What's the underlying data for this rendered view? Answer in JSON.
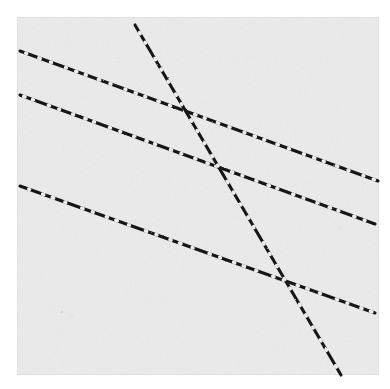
{
  "figure": {
    "canvas": {
      "width": 390,
      "height": 389
    },
    "page_background_color": "#ffffff",
    "paper": {
      "name": "scanned-paper-sheet",
      "x": 18,
      "y": 18,
      "width": 360,
      "height": 356,
      "fill_color": "#ececec",
      "edge_shadow_color": "#e0e0e0",
      "texture": "grainy-paper-speckle"
    },
    "stroke": {
      "color": "#141414",
      "width": 3.1,
      "linecap": "round",
      "dash_pattern": "broken-scanned-ink"
    }
  },
  "chart_data": {
    "type": "line",
    "subtitle": "",
    "xlabel": "",
    "ylabel": "",
    "xlim": [
      0,
      390
    ],
    "ylim": [
      389,
      0
    ],
    "grid": false,
    "legend_position": "none",
    "axes_visible": false,
    "tick_labels": {
      "x": [],
      "y": []
    },
    "coordinate_note": "Pixel coordinates, origin at top-left of the 390x389 image.",
    "series": [
      {
        "name": "line-1-upper-shallow",
        "stroke_color": "#141414",
        "slope": 0.363,
        "points": [
          {
            "x": 20,
            "y": 51
          },
          {
            "x": 378,
            "y": 181
          }
        ]
      },
      {
        "name": "line-2-middle-shallow",
        "stroke_color": "#141414",
        "slope": 0.363,
        "points": [
          {
            "x": 20,
            "y": 95
          },
          {
            "x": 375,
            "y": 224
          }
        ]
      },
      {
        "name": "line-3-lower-shallow",
        "stroke_color": "#141414",
        "slope": 0.358,
        "points": [
          {
            "x": 20,
            "y": 186
          },
          {
            "x": 375,
            "y": 313
          }
        ]
      },
      {
        "name": "line-4-steep-descending",
        "stroke_color": "#141414",
        "slope": 2.474,
        "points": [
          {
            "x": 135,
            "y": 25
          },
          {
            "x": 341,
            "y": 375
          }
        ]
      }
    ],
    "intersections": [
      {
        "name": "steep-with-line-1",
        "x": 188,
        "y": 110
      },
      {
        "name": "steep-with-line-2",
        "x": 218,
        "y": 163
      },
      {
        "name": "steep-with-line-3",
        "x": 288,
        "y": 283
      }
    ],
    "annotations": []
  }
}
